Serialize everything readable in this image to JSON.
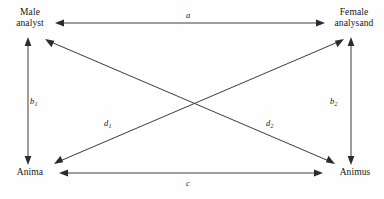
{
  "figure": {
    "kind": "relationship-diagram",
    "background_color": "#fefefe",
    "line_color": "#3a3a44",
    "text_color": "#161616"
  },
  "nodes": [
    {
      "id": "male-analyst",
      "line1": "Male",
      "line2": "analyst"
    },
    {
      "id": "female-analysand",
      "line1": "Female",
      "line2": "analysand"
    },
    {
      "id": "anima",
      "line1": "Anima",
      "line2": ""
    },
    {
      "id": "animus",
      "line1": "Animus",
      "line2": ""
    }
  ],
  "edges": [
    {
      "id": "a",
      "label": "a",
      "sub": "",
      "from": "male-analyst",
      "to": "female-analysand"
    },
    {
      "id": "b1",
      "label": "b",
      "sub": "1",
      "from": "male-analyst",
      "to": "anima"
    },
    {
      "id": "b2",
      "label": "b",
      "sub": "2",
      "from": "female-analysand",
      "to": "animus"
    },
    {
      "id": "c",
      "label": "c",
      "sub": "",
      "from": "anima",
      "to": "animus"
    },
    {
      "id": "d1",
      "label": "d",
      "sub": "1",
      "from": "anima",
      "to": "female-analysand"
    },
    {
      "id": "d2",
      "label": "d",
      "sub": "2",
      "from": "animus",
      "to": "male-analyst"
    }
  ]
}
